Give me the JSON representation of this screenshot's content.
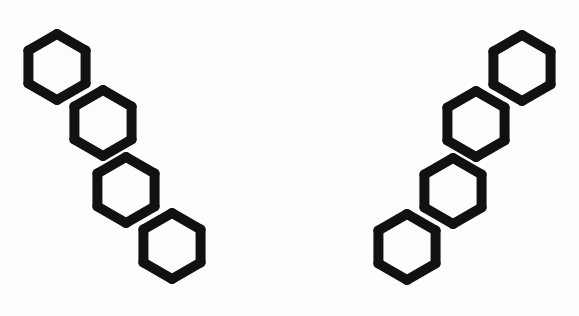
{
  "page": {
    "background_color": "#fdfdfd",
    "width": 579,
    "height": 316
  },
  "style": {
    "stroke_color": "#111111",
    "stroke_width": 10,
    "fill": "none",
    "hex_radius": 33,
    "hex_orientation": "pointy-top"
  },
  "figures": [
    {
      "id": "left-figure",
      "label": "Left fused hexagon chain",
      "description": "Four fused hexagons descending from upper-left to lower-right in an angular zigzag",
      "hexagon_count": 4,
      "direction": "down-right",
      "centers": [
        {
          "cx": 57,
          "cy": 67
        },
        {
          "cx": 103,
          "cy": 123
        },
        {
          "cx": 126,
          "cy": 190
        },
        {
          "cx": 172,
          "cy": 246
        }
      ]
    },
    {
      "id": "right-figure",
      "label": "Right fused hexagon chain (mirror image)",
      "description": "Four fused hexagons ascending from lower-left to upper-right in an angular zigzag",
      "hexagon_count": 4,
      "direction": "up-right",
      "centers": [
        {
          "cx": 407,
          "cy": 247
        },
        {
          "cx": 453,
          "cy": 191
        },
        {
          "cx": 476,
          "cy": 124
        },
        {
          "cx": 522,
          "cy": 68
        }
      ]
    }
  ]
}
